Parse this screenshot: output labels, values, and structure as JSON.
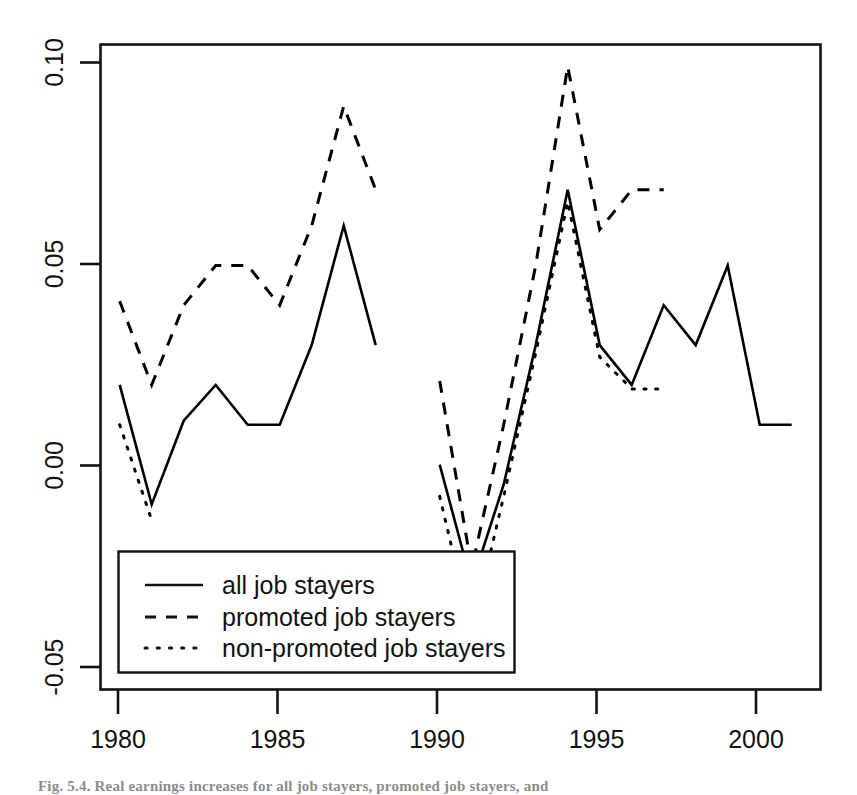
{
  "figure": {
    "caption": "Fig. 5.4.  Real earnings increases for all job stayers, promoted job stayers, and"
  },
  "axes": {
    "y_ticks": [
      "0.10",
      "0.05",
      "0.00",
      "-0.05"
    ],
    "y_tick_values": [
      0.1,
      0.05,
      0.0,
      -0.05
    ],
    "x_ticks": [
      "1980",
      "1985",
      "1990",
      "1995",
      "2000"
    ],
    "x_tick_values": [
      1980,
      1985,
      1990,
      1995,
      2000
    ],
    "xlim": [
      1979.4,
      2001.9
    ],
    "ylim": [
      -0.0565,
      0.1055
    ],
    "xlabel": "",
    "ylabel": ""
  },
  "legend": {
    "position": "bottom-left",
    "items": [
      {
        "label": "all job stayers",
        "style": "solid"
      },
      {
        "label": "promoted job stayers",
        "style": "dashed"
      },
      {
        "label": "non-promoted job stayers",
        "style": "dotted"
      }
    ]
  },
  "chart_data": {
    "type": "line",
    "title": "",
    "xlabel": "",
    "ylabel": "",
    "xlim": [
      1979.4,
      2001.9
    ],
    "ylim": [
      -0.0565,
      0.1055
    ],
    "grid": false,
    "legend_position": "bottom-left",
    "color": "#000000",
    "series": [
      {
        "name": "all job stayers",
        "style": "solid",
        "x": [
          1980,
          1981,
          1982,
          1983,
          1984,
          1985,
          1986,
          1987,
          1988
        ],
        "values": [
          0.02,
          -0.01,
          0.011,
          0.02,
          0.01,
          0.01,
          0.03,
          0.06,
          0.03
        ]
      },
      {
        "name": "all job stayers",
        "style": "solid",
        "x": [
          1990,
          1991,
          1992,
          1993,
          1994,
          1995,
          1996,
          1997,
          1998,
          1999,
          2000,
          2001
        ],
        "values": [
          0.0,
          -0.03,
          -0.005,
          0.03,
          0.069,
          0.03,
          0.02,
          0.04,
          0.03,
          0.05,
          0.01,
          0.01
        ]
      },
      {
        "name": "promoted job stayers",
        "style": "dashed",
        "x": [
          1980,
          1981,
          1982,
          1983,
          1984,
          1985,
          1986,
          1987,
          1988
        ],
        "values": [
          0.041,
          0.02,
          0.04,
          0.05,
          0.05,
          0.04,
          0.06,
          0.09,
          0.069
        ]
      },
      {
        "name": "promoted job stayers",
        "style": "dashed",
        "x": [
          1990,
          1991,
          1992,
          1993,
          1994,
          1995,
          1996,
          1997
        ],
        "values": [
          0.021,
          -0.026,
          0.01,
          0.05,
          0.1,
          0.059,
          0.069,
          0.069
        ]
      },
      {
        "name": "non-promoted job stayers",
        "style": "dotted",
        "x": [
          1980,
          1981
        ],
        "values": [
          0.01,
          -0.014
        ]
      },
      {
        "name": "non-promoted job stayers",
        "style": "dotted",
        "x": [
          1990,
          1991,
          1992,
          1993,
          1994,
          1995,
          1996,
          1997
        ],
        "values": [
          -0.008,
          -0.042,
          -0.008,
          0.028,
          0.066,
          0.027,
          0.019,
          0.019
        ]
      }
    ]
  }
}
